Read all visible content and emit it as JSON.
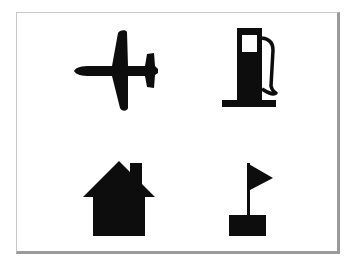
{
  "panel": {
    "icons": [
      {
        "name": "airplane",
        "label": "Airport",
        "position": "top-left"
      },
      {
        "name": "fuel-pump",
        "label": "Gas station",
        "position": "top-right"
      },
      {
        "name": "house",
        "label": "Home",
        "position": "bottom-left"
      },
      {
        "name": "flag",
        "label": "Destination flag",
        "position": "bottom-right"
      }
    ]
  },
  "colors": {
    "background": "#ffffff",
    "icon_fill": "#0d0d0d",
    "frame_border": "#9a9a9a"
  }
}
